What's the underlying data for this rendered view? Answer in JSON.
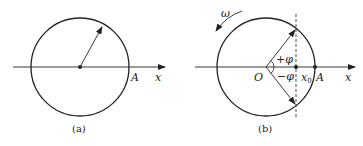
{
  "figures": [
    {
      "id": "a",
      "caption": "(a)",
      "labels": {
        "point_A": "A",
        "axis_x": "x"
      },
      "circle": {
        "cx": 80,
        "cy": 67,
        "r": 49
      },
      "radius_vector_tip": {
        "x": 102,
        "y": 25
      }
    },
    {
      "id": "b",
      "caption": "(b)",
      "labels": {
        "origin": "O",
        "point_A": "A",
        "axis_x": "x",
        "x0": "x",
        "x0_sub": "0",
        "plus_phi": "+φ",
        "minus_phi": "−φ",
        "omega": "ω"
      },
      "circle": {
        "cx": 266,
        "cy": 67,
        "r": 49
      },
      "dashed_line_x": 296
    }
  ],
  "colors": {
    "stroke": "#222222",
    "background": "#ffffff"
  }
}
